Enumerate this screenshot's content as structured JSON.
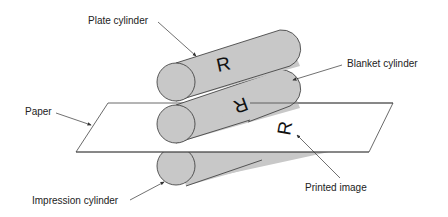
{
  "diagram": {
    "labels": {
      "plate_cylinder": "Plate cylinder",
      "blanket_cylinder": "Blanket cylinder",
      "paper": "Paper",
      "impression_cylinder": "Impression cylinder",
      "printed_image": "Printed image"
    },
    "glyphs": {
      "plate_image": "R",
      "blanket_image": "R",
      "printed_image": "R"
    },
    "colors": {
      "cylinder_fill": "#c8c8c8",
      "stroke": "#333333",
      "paper_fill": "#ffffff",
      "background": "#ffffff"
    }
  }
}
